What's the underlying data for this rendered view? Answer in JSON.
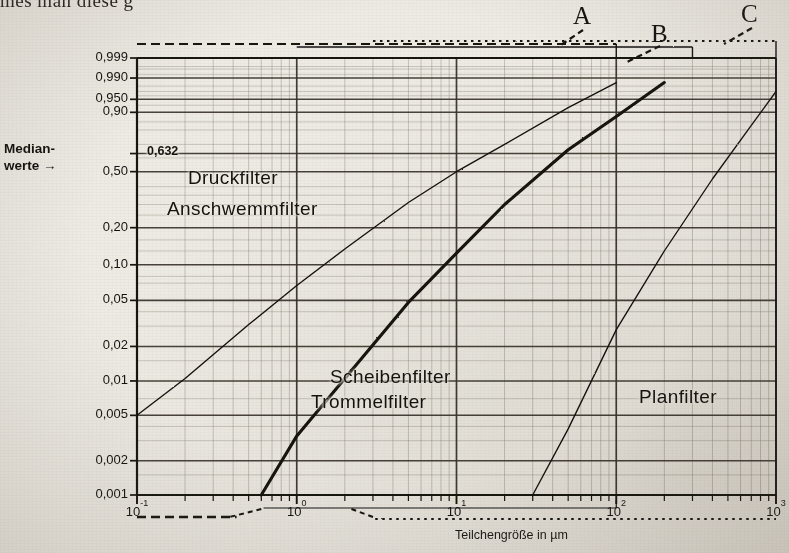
{
  "page": {
    "top_running_text": "mes man diese g"
  },
  "axes": {
    "y_axis_caption_line1": "Median-",
    "y_axis_caption_line2": "werte →",
    "x_axis_title": "Teilchengröße in µm",
    "y_tick_labels": [
      "0,999",
      "0,990",
      "0,950",
      "0,90",
      "0,50",
      "0,20",
      "0,10",
      "0,05",
      "0,02",
      "0,01",
      "0,005",
      "0,002",
      "0,001"
    ],
    "y_tick_values": [
      0.999,
      0.99,
      0.95,
      0.9,
      0.5,
      0.2,
      0.1,
      0.05,
      0.02,
      0.01,
      0.005,
      0.002,
      0.001
    ],
    "y_inline_label": "0,632",
    "x_tick_labels": [
      "10⁻¹",
      "10⁰",
      "10¹",
      "10²",
      "10³"
    ],
    "x_tick_mantissas": [
      "10",
      "10",
      "10",
      "10",
      "10"
    ],
    "x_tick_exponents": [
      "-1",
      "0",
      "1",
      "2",
      "3"
    ]
  },
  "brackets": [
    {
      "label": "A",
      "style": "dashed"
    },
    {
      "label": "B",
      "style": "solid"
    },
    {
      "label": "C",
      "style": "dotted"
    }
  ],
  "curve_labels": [
    {
      "id": "druckfilter",
      "text": "Druckfilter"
    },
    {
      "id": "anschwemmfilter",
      "text": "Anschwemmfilter"
    },
    {
      "id": "scheibenfilter",
      "text": "Scheibenfilter"
    },
    {
      "id": "trommelfilter",
      "text": "Trommelfilter"
    },
    {
      "id": "planfilter",
      "text": "Planfilter"
    }
  ],
  "colors": {
    "ink": "#15120f",
    "grid_major": "#3a342c",
    "grid_minor": "#8b8377",
    "paper": "#eeebe4"
  },
  "chart_data": {
    "type": "line",
    "title": "",
    "subtitle": "",
    "xlabel": "Teilchengröße in µm",
    "ylabel": "Medianwerte →",
    "xscale": "log",
    "yscale": "rrsb-probability",
    "xlim": [
      0.1,
      1000
    ],
    "ylim": [
      0.001,
      0.999
    ],
    "grid": true,
    "legend": "inline-annotations",
    "xticks": [
      0.1,
      1,
      10,
      100,
      1000
    ],
    "xticklabels": [
      "10^-1",
      "10^0",
      "10^1",
      "10^2",
      "10^3"
    ],
    "yticks": [
      0.001,
      0.002,
      0.005,
      0.01,
      0.02,
      0.05,
      0.1,
      0.2,
      0.5,
      0.632,
      0.9,
      0.95,
      0.99,
      0.999
    ],
    "yticklabels": [
      "0,001",
      "0,002",
      "0,005",
      "0,01",
      "0,02",
      "0,05",
      "0,10",
      "0,20",
      "0,50",
      "0,632",
      "0,90",
      "0,950",
      "0,990",
      "0,999"
    ],
    "annotations": [
      {
        "text": "0,632",
        "x": 0.115,
        "y": 0.632,
        "note": "RRSB characteristic ordinate"
      },
      {
        "text": "Druckfilter",
        "x": 0.35,
        "y": 0.4
      },
      {
        "text": "Anschwemmfilter",
        "x": 0.3,
        "y": 0.27
      },
      {
        "text": "Scheibenfilter",
        "x": 3.4,
        "y": 0.012
      },
      {
        "text": "Trommelfilter",
        "x": 3.2,
        "y": 0.0062
      },
      {
        "text": "Planfilter",
        "x": 80,
        "y": 0.0058
      },
      {
        "text": "A",
        "x": 110,
        "y": 0.9995
      },
      {
        "text": "B",
        "x": 220,
        "y": 0.9995
      },
      {
        "text": "C",
        "x": 600,
        "y": 0.9995
      }
    ],
    "series": [
      {
        "name": "Druckfilter / Anschwemmfilter",
        "style": "thin-solid",
        "x": [
          0.1,
          0.2,
          0.5,
          1.0,
          2.0,
          5.0,
          10,
          20,
          50,
          100
        ],
        "y": [
          0.005,
          0.0105,
          0.031,
          0.067,
          0.135,
          0.31,
          0.5,
          0.7,
          0.92,
          0.985
        ]
      },
      {
        "name": "Scheibenfilter / Trommelfilter",
        "style": "thick-solid",
        "x": [
          0.6,
          1.0,
          2.0,
          5.0,
          10,
          20,
          50,
          100,
          200
        ],
        "y": [
          0.001,
          0.0033,
          0.0105,
          0.048,
          0.125,
          0.3,
          0.66,
          0.88,
          0.985
        ]
      },
      {
        "name": "Planfilter",
        "style": "thin-solid",
        "x": [
          30,
          50,
          100,
          200,
          400,
          700,
          1000
        ],
        "y": [
          0.001,
          0.0038,
          0.028,
          0.13,
          0.45,
          0.83,
          0.97
        ]
      }
    ],
    "bracket_ranges": [
      {
        "label": "A",
        "from": 0.1,
        "to": 100,
        "style": "dashed"
      },
      {
        "label": "B",
        "from": 1.0,
        "to": 300,
        "style": "solid"
      },
      {
        "label": "C",
        "from": 3.0,
        "to": 1000,
        "style": "dotted"
      }
    ]
  }
}
